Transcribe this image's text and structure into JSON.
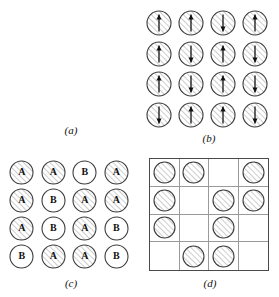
{
  "figure": {
    "panels": [
      {
        "id": "a",
        "label": "(a)",
        "type": "sign-grid",
        "rows": [
          [
            "+",
            "+",
            "−",
            "+"
          ],
          [
            "+",
            "−",
            "+",
            "+"
          ],
          [
            "+",
            "−",
            "+",
            "−"
          ],
          [
            "−",
            "+",
            "+",
            "−"
          ]
        ]
      },
      {
        "id": "b",
        "label": "(b)",
        "type": "spin-grid",
        "rows": [
          [
            "up",
            "up",
            "down",
            "up"
          ],
          [
            "up",
            "down",
            "up",
            "down"
          ],
          [
            "up",
            "down",
            "up",
            "down"
          ],
          [
            "down",
            "up",
            "up",
            "down"
          ]
        ]
      },
      {
        "id": "c",
        "label": "(c)",
        "type": "atom-grid",
        "rows": [
          [
            "A",
            "A",
            "B",
            "A"
          ],
          [
            "A",
            "B",
            "A",
            "A"
          ],
          [
            "A",
            "B",
            "A",
            "B"
          ],
          [
            "B",
            "A",
            "A",
            "B"
          ]
        ]
      },
      {
        "id": "d",
        "label": "(d)",
        "type": "occupancy-grid",
        "rows": [
          [
            1,
            1,
            0,
            1
          ],
          [
            1,
            0,
            1,
            1
          ],
          [
            1,
            0,
            1,
            0
          ],
          [
            0,
            1,
            1,
            0
          ]
        ]
      }
    ],
    "colors": {
      "background": "#ffffff",
      "ink": "#1a1a1a",
      "sign_stroke": "#3a3a3a",
      "circle_stroke": "#3d3d3d",
      "hatch_stroke": "#9b9b9b",
      "grid_line": "#9a9a9a",
      "grid_border": "#4a4a4a"
    }
  }
}
